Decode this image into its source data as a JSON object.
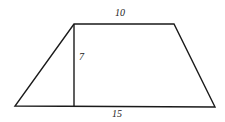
{
  "figure": {
    "shape": "trapezoid",
    "labels": {
      "top_base": "10",
      "height": "7",
      "bottom_base": "15"
    },
    "colors": {
      "stroke": "#1a1a1a",
      "background": "#ffffff"
    }
  }
}
